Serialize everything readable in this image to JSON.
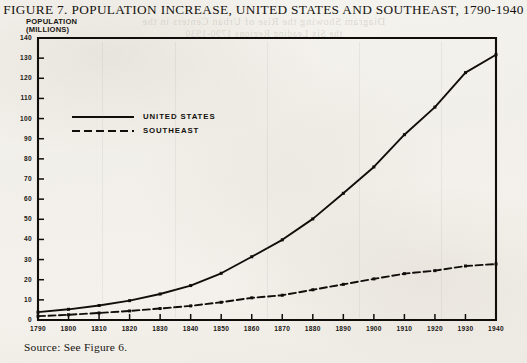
{
  "figure": {
    "title": "FIGURE 7.  POPULATION INCREASE, UNITED STATES AND SOUTHEAST, 1790-1940",
    "source": "Source: See Figure 6.",
    "axis_title_line1": "POPULATION",
    "axis_title_line2": "(MILLIONS)",
    "showthrough_line1": "Diagram Showing the Rise of Urban Centers in the",
    "showthrough_line2": "the Six Leading Regions 1790-1930"
  },
  "legend": {
    "position": "inside-upper-left",
    "entries": [
      {
        "label": "UNITED STATES",
        "style": "solid"
      },
      {
        "label": "SOUTHEAST",
        "style": "dashed"
      }
    ]
  },
  "chart_data": {
    "type": "line",
    "title": "FIGURE 7.  POPULATION INCREASE, UNITED STATES AND SOUTHEAST, 1790-1940",
    "xlabel": "",
    "ylabel": "POPULATION (MILLIONS)",
    "xlim": [
      1790,
      1940
    ],
    "ylim": [
      0,
      140
    ],
    "ytick_step": 10,
    "xtick_step": 10,
    "grid": false,
    "markers": true,
    "x": [
      1790,
      1800,
      1810,
      1820,
      1830,
      1840,
      1850,
      1860,
      1870,
      1880,
      1890,
      1900,
      1910,
      1920,
      1930,
      1940
    ],
    "xtick_labels": [
      "1790",
      "1800",
      "1810",
      "1820",
      "1830",
      "1840",
      "1850",
      "1860",
      "1870",
      "1880",
      "1890",
      "1900",
      "1910",
      "1920",
      "1930",
      "1940"
    ],
    "ytick_labels": [
      "0",
      "10",
      "20",
      "30",
      "40",
      "50",
      "60",
      "70",
      "80",
      "90",
      "100",
      "110",
      "120",
      "130",
      "140"
    ],
    "series": [
      {
        "name": "UNITED STATES",
        "style": "solid",
        "color": "#100d0a",
        "values": [
          3.9,
          5.3,
          7.2,
          9.6,
          12.9,
          17.1,
          23.2,
          31.4,
          39.8,
          50.2,
          62.9,
          76.0,
          92.0,
          105.7,
          122.8,
          131.7
        ]
      },
      {
        "name": "SOUTHEAST",
        "style": "dashed",
        "color": "#100d0a",
        "values": [
          1.9,
          2.6,
          3.5,
          4.5,
          5.7,
          7.0,
          8.8,
          11.0,
          12.3,
          15.0,
          17.7,
          20.4,
          23.0,
          24.5,
          26.8,
          27.8
        ]
      }
    ]
  }
}
